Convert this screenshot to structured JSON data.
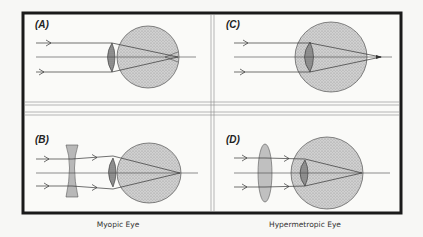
{
  "figure": {
    "panels": [
      {
        "id": "A",
        "label": "(A)",
        "description": "Myopic eye, uncorrected: parallel rays focus in front of retina"
      },
      {
        "id": "B",
        "label": "(B)",
        "description": "Myopic eye corrected with concave (diverging) lens"
      },
      {
        "id": "C",
        "label": "(C)",
        "description": "Hypermetropic eye, uncorrected: rays focus behind retina"
      },
      {
        "id": "D",
        "label": "(D)",
        "description": "Hypermetropic eye corrected with convex (converging) lens"
      }
    ],
    "captions": {
      "left": "Myopic Eye",
      "right": "Hypermetropic Eye"
    },
    "colors": {
      "background": "#f7f7f5",
      "frame": "#1a1a1a",
      "divider": "#777777",
      "eye_fill": "#c8c8c8",
      "lens_fill": "#a8a8a8",
      "ray": "#333333"
    }
  }
}
